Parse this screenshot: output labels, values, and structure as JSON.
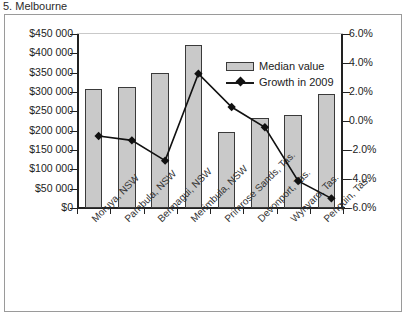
{
  "cut_off_title": "5. Melbourne",
  "legend": {
    "position": "inside-top-right",
    "items": [
      {
        "label": "Median value",
        "marker": "bar-swatch",
        "color": "#c9c9c9"
      },
      {
        "label": "Growth in 2009",
        "marker": "line-diamond",
        "color": "#111111"
      }
    ]
  },
  "chart_data": {
    "type": "bar",
    "title": "",
    "xlabel": "",
    "ylabel": "",
    "grid": false,
    "categories": [
      "Moruya, NSW",
      "Pambula, NSW",
      "Bermagui, NSW",
      "Merimbula, NSW",
      "Primrose Sands, Tas.",
      "Devonport, Tas.",
      "Wynyard, Tas.",
      "Penguin, Tas."
    ],
    "series": [
      {
        "name": "Median value",
        "type": "bar",
        "axis": "left",
        "values": [
          308000,
          312000,
          350000,
          422000,
          197000,
          233000,
          241000,
          295000
        ]
      },
      {
        "name": "Growth in 2009",
        "type": "line",
        "axis": "right",
        "values": [
          0.0,
          -0.3,
          -1.7,
          4.3,
          2.0,
          0.6,
          -3.1,
          -4.3
        ]
      }
    ],
    "left_axis": {
      "ylim": [
        0,
        450000
      ],
      "tick_values": [
        450000,
        400000,
        350000,
        300000,
        250000,
        200000,
        150000,
        100000,
        50000,
        0
      ],
      "tick_labels": [
        "$450 000",
        "$400 000",
        "$350 000",
        "$300 000",
        "$250 000",
        "$200 000",
        "$150 000",
        "$100 000",
        "$50 000",
        "$0"
      ]
    },
    "right_axis": {
      "ylim": [
        -6.0,
        6.0
      ],
      "tick_values": [
        6.0,
        4.0,
        2.0,
        0.0,
        -2.0,
        -4.0,
        -6.0
      ],
      "tick_labels": [
        "6.0%",
        "4.0%",
        "2.0%",
        "0.0%",
        "-2.0%",
        "-4.0%",
        "-6.0%"
      ]
    }
  }
}
